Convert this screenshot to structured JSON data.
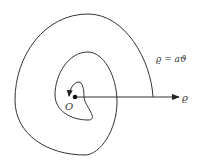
{
  "diagram": {
    "type": "archimedean-spiral",
    "equation_label": "ϱ = aϑ",
    "origin_label": "O",
    "axis_label": "ϱ",
    "colors": {
      "stroke": "#333333",
      "background": "#ffffff"
    }
  }
}
